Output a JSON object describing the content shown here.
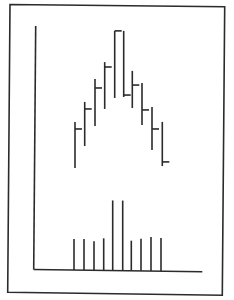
{
  "chart_data": [
    {
      "type": "bar",
      "subtype": "ohlc-high-low-close",
      "title": "",
      "xlabel": "",
      "ylabel": "",
      "grid": false,
      "legend": null,
      "note": "No axis tick labels are shown; values are relative units read from pixel positions (0 = x-axis baseline, 100 = top of y-axis).",
      "x": [
        1,
        2,
        3,
        4,
        5,
        6,
        7,
        8,
        9,
        10
      ],
      "series": [
        {
          "name": "High",
          "values": [
            60.7,
            68.9,
            78.3,
            85.2,
            98.0,
            98.0,
            81.6,
            76.6,
            66.8,
            60.7
          ]
        },
        {
          "name": "Low",
          "values": [
            41.8,
            50.8,
            59.0,
            66.0,
            70.5,
            70.9,
            66.4,
            59.4,
            49.2,
            42.6
          ]
        },
        {
          "name": "Close",
          "values": [
            57.8,
            66.0,
            74.6,
            83.2,
            98.0,
            71.7,
            75.8,
            65.6,
            57.8,
            44.3
          ]
        }
      ],
      "ylim": [
        0,
        100
      ]
    },
    {
      "type": "bar",
      "subtype": "volume",
      "title": "",
      "xlabel": "",
      "ylabel": "",
      "grid": false,
      "legend": null,
      "note": "Volume bars in relative pixel-height units.",
      "x": [
        1,
        2,
        3,
        4,
        5,
        6,
        7,
        8,
        9,
        10
      ],
      "values": [
        31,
        31,
        29,
        32,
        70,
        70,
        30,
        32,
        34,
        33
      ],
      "ylim": [
        0,
        100
      ]
    }
  ],
  "style": {
    "ink_color": "#2b2b2b",
    "background_color": "#ffffff"
  },
  "layout": {
    "frame": {
      "x1": 9,
      "y1": 5,
      "x2": 224,
      "y2": 294
    },
    "y_axis": {
      "x_top": 35.5,
      "y_top": 26,
      "x_bottom": 33.7,
      "y_bottom": 270
    },
    "x_axis": {
      "x_start": 33.7,
      "y_start": 269.5,
      "x_end": 202.5,
      "y_end": 271.5
    },
    "price_baseline_y": 270,
    "price_px_per_unit": 2.44,
    "bar_x": [
      75,
      84.7,
      95,
      104.7,
      114.7,
      123.7,
      132.3,
      142,
      152,
      162.3
    ],
    "vol_x": [
      74,
      84,
      94,
      103.7,
      112.7,
      122.7,
      131.3,
      141,
      151,
      161
    ],
    "vol_baseline_y": 269.5,
    "vol_px_per_unit": 1.0,
    "tick_len": 7
  }
}
